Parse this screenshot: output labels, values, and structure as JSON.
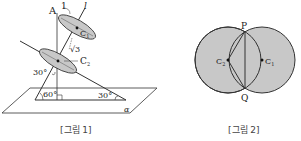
{
  "figure1": {
    "caption": "[그림 1]",
    "labels": {
      "A": "A",
      "one": "1",
      "l": "l",
      "C1": "C",
      "C1_sub": "1",
      "sqrt3": "√3",
      "C2": "C",
      "C2_sub": "2",
      "angle30_left": "30°",
      "angle60": "60°",
      "angle30_right": "30°",
      "alpha": "α"
    }
  },
  "figure2": {
    "caption": "[그림 2]",
    "labels": {
      "P": "P",
      "Q": "Q",
      "C2": "C",
      "C2_sub": "2",
      "C1": "C",
      "C1_sub": "1"
    }
  },
  "colors": {
    "fill": "#c8c8c8",
    "stroke": "#333333",
    "background": "#ffffff"
  }
}
